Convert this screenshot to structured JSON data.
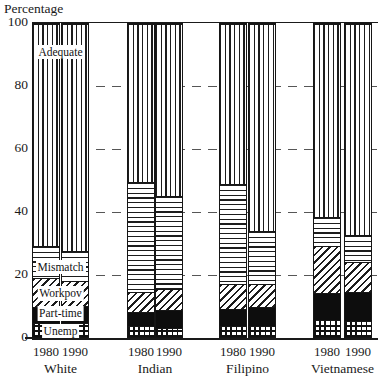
{
  "y_axis": {
    "title": "Percentage",
    "ticks": [
      100,
      80,
      60,
      40,
      20,
      0
    ],
    "gridlines": [
      80,
      60,
      40,
      20
    ]
  },
  "chart_data": {
    "type": "bar",
    "stacked": true,
    "ylabel": "Percentage",
    "ylim": [
      0,
      100
    ],
    "grid": "dashed-horizontal",
    "legend_position": "inline-on-first-group",
    "categories": [
      "White",
      "Indian",
      "Filipino",
      "Vietnamese"
    ],
    "bar_labels": [
      "1980",
      "1990"
    ],
    "segments": [
      "Unemp",
      "Part-time",
      "Workpov",
      "Mismatch",
      "Adequate"
    ],
    "values": {
      "White": {
        "1980": {
          "Unemp": 4.5,
          "Part-time": 5,
          "Workpov": 9.5,
          "Mismatch": 10,
          "Adequate": 71
        },
        "1990": {
          "Unemp": 4.5,
          "Part-time": 5.5,
          "Workpov": 8,
          "Mismatch": 9.5,
          "Adequate": 72.5
        }
      },
      "Indian": {
        "1980": {
          "Unemp": 3.5,
          "Part-time": 4.5,
          "Workpov": 6.5,
          "Mismatch": 35,
          "Adequate": 50.5
        },
        "1990": {
          "Unemp": 3,
          "Part-time": 5.5,
          "Workpov": 7,
          "Mismatch": 29.5,
          "Adequate": 55
        }
      },
      "Filipino": {
        "1980": {
          "Unemp": 3.5,
          "Part-time": 5.5,
          "Workpov": 8,
          "Mismatch": 32,
          "Adequate": 51
        },
        "1990": {
          "Unemp": 3.5,
          "Part-time": 6,
          "Workpov": 7.5,
          "Mismatch": 17,
          "Adequate": 66
        }
      },
      "Vietnamese": {
        "1980": {
          "Unemp": 5.5,
          "Part-time": 8.5,
          "Workpov": 15,
          "Mismatch": 9.5,
          "Adequate": 61.5
        },
        "1990": {
          "Unemp": 5,
          "Part-time": 9.5,
          "Workpov": 9.5,
          "Mismatch": 8.5,
          "Adequate": 67.5
        }
      }
    },
    "inline_labels": [
      {
        "text": "Adequate",
        "center_pct": 90.5
      },
      {
        "text": "Mismatch",
        "center_pct": 22.3
      },
      {
        "text": "Workpov",
        "center_pct": 13.9
      },
      {
        "text": "Part-time",
        "center_pct": 7.5
      },
      {
        "text": "Unemp",
        "center_pct": 1.9
      }
    ],
    "colors": {
      "ink": "#1a1a1a",
      "part_time_fill": "#0d0d0d",
      "background": "#ffffff",
      "gridline": "#565656"
    }
  }
}
